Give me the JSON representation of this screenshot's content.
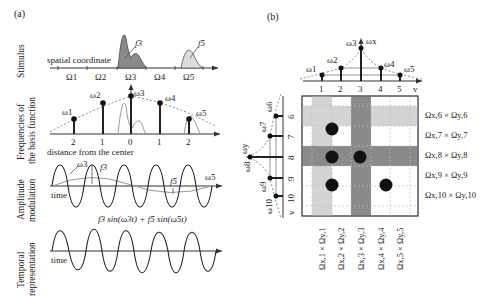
{
  "panel_a": {
    "label": "(a)",
    "rows": [
      {
        "label_line1": "Stimulus",
        "label_line2": ""
      },
      {
        "label_line1": "Frequencies of",
        "label_line2": "the basis function"
      },
      {
        "label_line1": "Amplitude",
        "label_line2": "modulation"
      },
      {
        "label_line1": "Temporal",
        "label_line2": "representation"
      }
    ],
    "stimulus": {
      "axis_label": "spatial coordinate",
      "regions": [
        "Ω1",
        "Ω2",
        "Ω3",
        "Ω4",
        "Ω5"
      ],
      "features": [
        "f3",
        "f5"
      ]
    },
    "frequencies": {
      "omegas": [
        "ω1",
        "ω2",
        "ω3",
        "ω4",
        "ω5"
      ],
      "ticks": [
        "2",
        "1",
        "0",
        "1",
        "2"
      ],
      "axis_label": "distance from the center"
    },
    "amplitude": {
      "labels": [
        "ω3",
        "f3",
        "f5",
        "ω5"
      ],
      "axis_label": "time"
    },
    "temporal": {
      "formula": "f3 sin(ω3t) + f5 sin(ω5t)",
      "axis_label": "time"
    }
  },
  "panel_b": {
    "label": "(b)",
    "x_axis": {
      "ticks": [
        "1",
        "2",
        "3",
        "4",
        "5"
      ],
      "var": "v",
      "omegas": [
        "ω1",
        "ω2",
        "ω3",
        "ω4",
        "ω5"
      ],
      "axis_omega": "ωx"
    },
    "y_axis": {
      "ticks": [
        "6",
        "7",
        "8",
        "9",
        "10"
      ],
      "var": "v",
      "omegas": [
        "ω6",
        "ω7",
        "ω8",
        "ω9",
        "ω10"
      ],
      "axis_omega": "ωy"
    },
    "row_labels": [
      "Ωx,6 × Ωy,6",
      "Ωx,7 × Ωy,7",
      "Ωx,8 × Ωy,8",
      "Ωx,9 × Ωy,9",
      "Ωx,10 × Ωy,10"
    ],
    "col_labels": [
      "Ωx,1 × Ωy,1",
      "Ωx,2 × Ωy,2",
      "Ωx,3 × Ωy,3",
      "Ωx,4 × Ωy,4",
      "Ωx,5 × Ωy,5"
    ],
    "dots": [
      [
        2,
        7
      ],
      [
        2,
        8
      ],
      [
        3,
        8
      ],
      [
        2,
        9
      ],
      [
        4,
        9
      ]
    ],
    "colors": {
      "light_band": "#d4d4d4",
      "dark_band": "#8a8a8a",
      "dot": "#111111"
    }
  }
}
